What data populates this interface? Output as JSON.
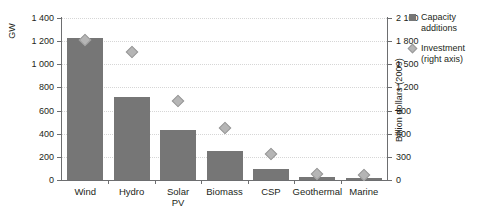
{
  "chart_data": {
    "type": "bar",
    "title": "",
    "subtitle": "",
    "categories": [
      "Wind",
      "Hydro",
      "Solar\nPV",
      "Biomass",
      "CSP",
      "Geothermal",
      "Marine"
    ],
    "series": [
      {
        "name": "Capacity additions",
        "axis": "left",
        "marker": "square",
        "color": "#767676",
        "values": [
          1230,
          720,
          430,
          250,
          95,
          30,
          18
        ]
      },
      {
        "name": "Investment (right axis)",
        "axis": "right",
        "marker": "diamond",
        "color": "#b5b5b5",
        "values": [
          1810,
          1660,
          1020,
          670,
          340,
          75,
          70
        ]
      }
    ],
    "xlabel": "",
    "ylabel": "GW",
    "ylabel_right": "Billion dollars (2009)",
    "ylim": [
      0,
      1400
    ],
    "ylim_right": [
      0,
      2100
    ],
    "yticks": [
      "0",
      "200",
      "400",
      "600",
      "800",
      "1 000",
      "1 200",
      "1 400"
    ],
    "ytick_values": [
      0,
      200,
      400,
      600,
      800,
      1000,
      1200,
      1400
    ],
    "yticks_right": [
      "0",
      "300",
      "600",
      "900",
      "1 200",
      "1 500",
      "1 800",
      "2 100"
    ],
    "ytick_values_right": [
      0,
      300,
      600,
      900,
      1200,
      1500,
      1800,
      2100
    ],
    "grid": true,
    "grid_style": "dotted",
    "legend_position": "right"
  },
  "legend": {
    "items": [
      {
        "label": "Capacity\nadditions",
        "marker": "square-icon"
      },
      {
        "label": "Investment\n(right axis)",
        "marker": "diamond-icon"
      }
    ]
  },
  "axes": {
    "left_title": "GW",
    "right_title": "Billion dollars (2009)"
  }
}
